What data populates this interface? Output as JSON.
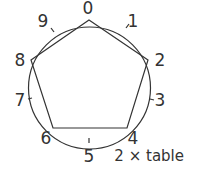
{
  "diagram": {
    "caption": "2 × table",
    "labels": [
      "0",
      "1",
      "2",
      "3",
      "4",
      "5",
      "6",
      "7",
      "8",
      "9"
    ],
    "polygon_sequence": [
      "0",
      "2",
      "4",
      "6",
      "8"
    ],
    "stroke_color": "#333333"
  }
}
